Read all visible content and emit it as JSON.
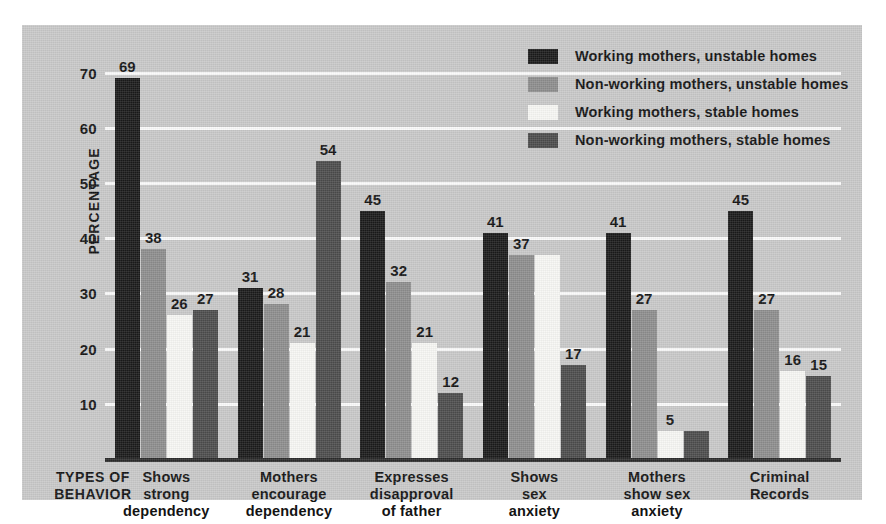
{
  "chart_data": {
    "type": "bar",
    "title": "",
    "xlabel": "TYPES OF BEHAVIOR",
    "ylabel": "PERCENTAGE",
    "ylim": [
      0,
      74
    ],
    "yticks": [
      10,
      20,
      30,
      40,
      50,
      60,
      70
    ],
    "grid": true,
    "legend_position": "top-right",
    "categories": [
      "Shows strong dependency",
      "Mothers encourage dependency",
      "Expresses disapproval of father",
      "Shows sex anxiety",
      "Mothers show sex anxiety",
      "Criminal Records"
    ],
    "category_lines": [
      [
        "Shows",
        "strong",
        "dependency"
      ],
      [
        "Mothers",
        "encourage",
        "dependency"
      ],
      [
        "Expresses",
        "disapproval",
        "of father"
      ],
      [
        "Shows",
        "sex",
        "anxiety"
      ],
      [
        "Mothers",
        "show sex",
        "anxiety"
      ],
      [
        "Criminal",
        "Records"
      ]
    ],
    "series": [
      {
        "name": "Working mothers, unstable homes",
        "color": "#1b1b1b",
        "values": [
          69,
          31,
          45,
          41,
          41,
          45
        ]
      },
      {
        "name": "Non-working mothers, unstable homes",
        "color": "#8d8d8d",
        "values": [
          38,
          28,
          32,
          37,
          27,
          27
        ]
      },
      {
        "name": "Working mothers, stable homes",
        "color": "#f7f7f4",
        "values": [
          26,
          21,
          21,
          37,
          5,
          16
        ]
      },
      {
        "name": "Non-working mothers, stable homes",
        "color": "#4c4c4c",
        "values": [
          27,
          54,
          12,
          17,
          5,
          15
        ]
      }
    ],
    "value_labels": [
      [
        "69",
        "38",
        "26",
        "27"
      ],
      [
        "31",
        "28",
        "21",
        "54"
      ],
      [
        "45",
        "32",
        "21",
        "12"
      ],
      [
        "41",
        "37",
        "",
        "17"
      ],
      [
        "41",
        "27",
        "5",
        ""
      ],
      [
        "45",
        "27",
        "16",
        "15"
      ]
    ],
    "ytick_labels": [
      "70",
      "60",
      "50",
      "40",
      "30",
      "20",
      "10"
    ],
    "background_color": "#c9c9c9",
    "gridline_color": "#fbfbfb",
    "axis_color": "#2b2b2b",
    "text_color": "#141414"
  },
  "legend": {
    "items": [
      {
        "label": "Working mothers, unstable homes",
        "color": "#1b1b1b"
      },
      {
        "label": "Non-working mothers, unstable homes",
        "color": "#8d8d8d"
      },
      {
        "label": "Working mothers, stable homes",
        "color": "#f7f7f4"
      },
      {
        "label": "Non-working mothers, stable homes",
        "color": "#4c4c4c"
      }
    ]
  },
  "axis": {
    "y_title": "PERCENTAGE",
    "x_title_line1": "TYPES OF",
    "x_title_line2": "BEHAVIOR"
  }
}
